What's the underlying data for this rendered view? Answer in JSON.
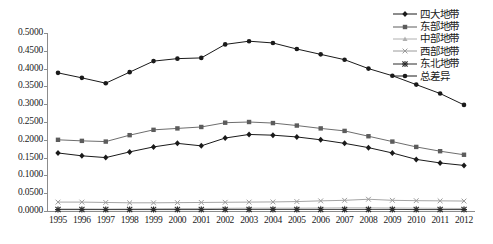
{
  "chart_data": {
    "type": "line",
    "title": "",
    "xlabel": "",
    "ylabel": "",
    "grid": false,
    "legend_position": "top-right",
    "ylim": [
      0.0,
      0.5
    ],
    "ytick_labels": [
      "0.5000",
      "0.4500",
      "0.4000",
      "0.3500",
      "0.3000",
      "0.2500",
      "0.2000",
      "0.1500",
      "0.1000",
      "0.0500",
      "0.0000"
    ],
    "ytick_values": [
      0.5,
      0.45,
      0.4,
      0.35,
      0.3,
      0.25,
      0.2,
      0.15,
      0.1,
      0.05,
      0.0
    ],
    "categories": [
      "1995",
      "1996",
      "1997",
      "1998",
      "1999",
      "2000",
      "2001",
      "2002",
      "2003",
      "2004",
      "2005",
      "2006",
      "2007",
      "2008",
      "2009",
      "2010",
      "2011",
      "2012"
    ],
    "series": [
      {
        "name": "四大地带",
        "marker": "diamond",
        "color": "#1a1a1a",
        "values": [
          0.163,
          0.155,
          0.15,
          0.166,
          0.18,
          0.19,
          0.183,
          0.205,
          0.215,
          0.213,
          0.208,
          0.2,
          0.19,
          0.178,
          0.163,
          0.145,
          0.135,
          0.128
        ]
      },
      {
        "name": "东部地带",
        "marker": "square",
        "color": "#5c5c5c",
        "values": [
          0.2,
          0.197,
          0.195,
          0.213,
          0.228,
          0.232,
          0.236,
          0.248,
          0.25,
          0.247,
          0.24,
          0.232,
          0.225,
          0.21,
          0.195,
          0.18,
          0.168,
          0.158
        ]
      },
      {
        "name": "中部地带",
        "marker": "triangle",
        "color": "#b0b0b0",
        "values": [
          0.006,
          0.006,
          0.0055,
          0.006,
          0.0065,
          0.007,
          0.007,
          0.0075,
          0.008,
          0.008,
          0.008,
          0.0085,
          0.009,
          0.009,
          0.0085,
          0.008,
          0.0075,
          0.007
        ]
      },
      {
        "name": "西部地带",
        "marker": "cross",
        "color": "#9a9a9a",
        "values": [
          0.025,
          0.025,
          0.024,
          0.023,
          0.023,
          0.0235,
          0.024,
          0.0245,
          0.025,
          0.0255,
          0.0265,
          0.0285,
          0.03,
          0.033,
          0.03,
          0.029,
          0.0285,
          0.028
        ]
      },
      {
        "name": "东北地带",
        "marker": "star",
        "color": "#2b2b2b",
        "values": [
          0.004,
          0.004,
          0.004,
          0.004,
          0.004,
          0.004,
          0.004,
          0.0045,
          0.0045,
          0.0045,
          0.0045,
          0.0045,
          0.0045,
          0.0045,
          0.0045,
          0.004,
          0.004,
          0.004
        ]
      },
      {
        "name": "总差异",
        "marker": "circle",
        "color": "#1a1a1a",
        "values": [
          0.388,
          0.374,
          0.359,
          0.39,
          0.421,
          0.428,
          0.43,
          0.468,
          0.477,
          0.472,
          0.455,
          0.44,
          0.425,
          0.4,
          0.38,
          0.355,
          0.33,
          0.298
        ]
      }
    ]
  },
  "caption": ""
}
